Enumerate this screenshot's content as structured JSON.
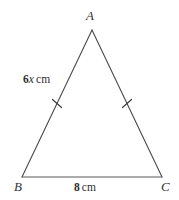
{
  "figure": {
    "type": "geometry-diagram",
    "shape": "isosceles-triangle",
    "background_color": "#ffffff",
    "stroke_color": "#4a4a4a",
    "text_color": "#333333",
    "vertices": [
      {
        "name": "A",
        "label": "A",
        "position": "apex-top",
        "x": 92,
        "y": 30
      },
      {
        "name": "B",
        "label": "B",
        "position": "bottom-left",
        "x": 22,
        "y": 177
      },
      {
        "name": "C",
        "label": "C",
        "position": "bottom-right",
        "x": 162,
        "y": 177
      }
    ],
    "sides": [
      {
        "name": "AB",
        "label_number": "6",
        "label_variable": "x",
        "label_unit": "cm",
        "label_full": "6x cm",
        "tick_marks": 1,
        "position": "left-leg"
      },
      {
        "name": "AC",
        "label_full": "",
        "tick_marks": 1,
        "position": "right-leg"
      },
      {
        "name": "BC",
        "label_number": "8",
        "label_unit": "cm",
        "label_full": "8 cm",
        "tick_marks": 0,
        "position": "base"
      }
    ]
  }
}
